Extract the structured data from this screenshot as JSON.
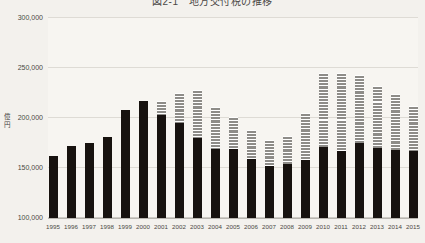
{
  "chart_data": {
    "type": "bar",
    "stacked": true,
    "title": "図2-1　地方交付税の推移",
    "xlabel": "",
    "ylabel": "億円",
    "ylim": [
      100000,
      300000
    ],
    "yticks": [
      100000,
      150000,
      200000,
      250000,
      300000
    ],
    "ytick_labels": [
      "100,000",
      "150,000",
      "200,000",
      "250,000",
      "300,000"
    ],
    "grid": true,
    "legend_position": "top-center",
    "categories": [
      "1995",
      "1996",
      "1997",
      "1998",
      "1999",
      "2000",
      "2001",
      "2002",
      "2003",
      "2004",
      "2005",
      "2006",
      "2007",
      "2008",
      "2009",
      "2010",
      "2011",
      "2012",
      "2013",
      "2014",
      "2015"
    ],
    "series": [
      {
        "name": "交付税",
        "color": "#17120f",
        "values": [
          162000,
          172000,
          175000,
          181000,
          208000,
          217000,
          203000,
          195000,
          180000,
          169000,
          169000,
          159000,
          152000,
          154000,
          158000,
          171000,
          167000,
          175000,
          170000,
          168000,
          167000
        ]
      },
      {
        "name": "臨時財政対策債",
        "color": "#8e8c88",
        "values": [
          0,
          0,
          0,
          0,
          0,
          0,
          14000,
          30000,
          48000,
          42000,
          32000,
          29000,
          26000,
          28000,
          47000,
          74000,
          78000,
          68000,
          62000,
          56000,
          45000
        ]
      }
    ],
    "totals": [
      162000,
      172000,
      175000,
      181000,
      208000,
      217000,
      217000,
      225000,
      228000,
      211000,
      201000,
      188000,
      178000,
      182000,
      205000,
      245000,
      245000,
      243000,
      232000,
      224000,
      212000
    ]
  }
}
